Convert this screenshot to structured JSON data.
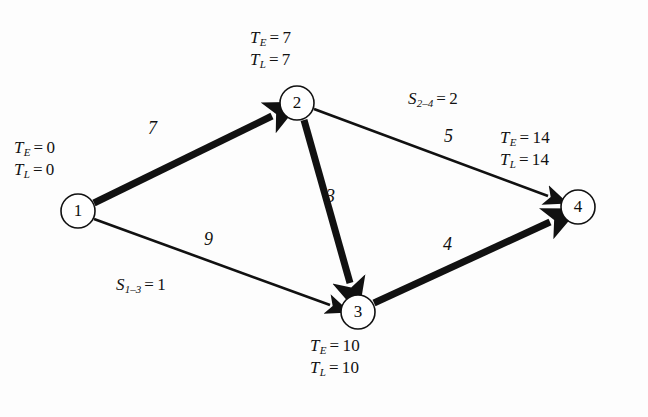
{
  "figure": {
    "background_color": "#fdfdfd",
    "line_color": "#111111"
  },
  "nodes": [
    {
      "id": "1",
      "label": "1",
      "cx": 78,
      "cy": 211,
      "r": 17,
      "te_label": "T",
      "te_sub": "E",
      "te_eq": "=",
      "te_value": "0",
      "tl_label": "T",
      "tl_sub": "L",
      "tl_eq": "=",
      "tl_value": "0"
    },
    {
      "id": "2",
      "label": "2",
      "cx": 297,
      "cy": 103,
      "r": 17,
      "te_label": "T",
      "te_sub": "E",
      "te_eq": "=",
      "te_value": "7",
      "tl_label": "T",
      "tl_sub": "L",
      "tl_eq": "=",
      "tl_value": "7"
    },
    {
      "id": "3",
      "label": "3",
      "cx": 358,
      "cy": 312,
      "r": 17,
      "te_label": "T",
      "te_sub": "E",
      "te_eq": "=",
      "te_value": "10",
      "tl_label": "T",
      "tl_sub": "L",
      "tl_eq": "=",
      "tl_value": "10"
    },
    {
      "id": "4",
      "label": "4",
      "cx": 578,
      "cy": 207,
      "r": 17,
      "te_label": "T",
      "te_sub": "E",
      "te_eq": "=",
      "te_value": "14",
      "tl_label": "T",
      "tl_sub": "L",
      "tl_eq": "=",
      "tl_value": "14"
    }
  ],
  "edges": [
    {
      "id": "1-2",
      "from": "1",
      "to": "2",
      "weight": "7",
      "critical": true,
      "weight_x": 148,
      "weight_y": 118
    },
    {
      "id": "1-3",
      "from": "1",
      "to": "3",
      "weight": "9",
      "critical": false,
      "weight_x": 204,
      "weight_y": 229
    },
    {
      "id": "2-3",
      "from": "2",
      "to": "3",
      "weight": "3",
      "critical": true,
      "weight_x": 326,
      "weight_y": 186
    },
    {
      "id": "2-4",
      "from": "2",
      "to": "4",
      "weight": "5",
      "critical": false,
      "weight_x": 444,
      "weight_y": 126
    },
    {
      "id": "3-4",
      "from": "3",
      "to": "4",
      "weight": "4",
      "critical": true,
      "weight_x": 443,
      "weight_y": 234
    }
  ],
  "slacks": [
    {
      "id": "S1-3",
      "sym": "S",
      "sub": "1–3",
      "eq": "=",
      "value": "1",
      "x": 116,
      "y": 273
    },
    {
      "id": "S2-4",
      "sym": "S",
      "sub": "2–4",
      "eq": "=",
      "value": "2",
      "x": 408,
      "y": 87
    }
  ],
  "time_blocks": [
    {
      "node": "1",
      "x": 14,
      "y": 136
    },
    {
      "node": "2",
      "x": 250,
      "y": 26
    },
    {
      "node": "3",
      "x": 310,
      "y": 334
    },
    {
      "node": "4",
      "x": 500,
      "y": 126
    }
  ],
  "geometry": {
    "thin_width": 2.6,
    "thick_width": 7.0,
    "node_stroke": 1.6,
    "node_fill": "#ffffff"
  }
}
